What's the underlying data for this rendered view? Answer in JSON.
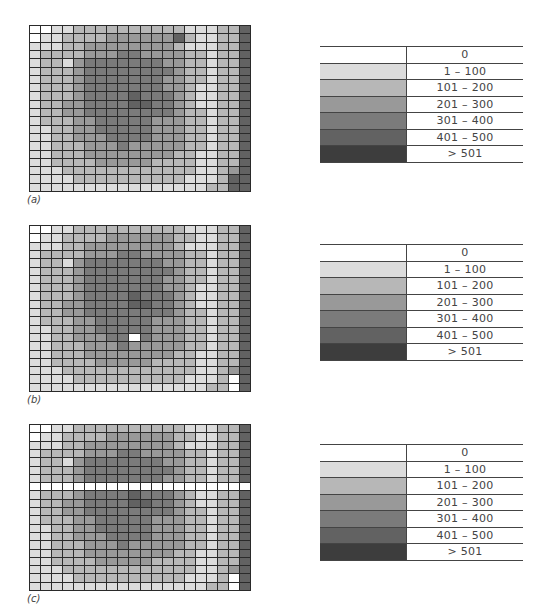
{
  "levels": [
    {
      "label": "0",
      "color": "#ffffff"
    },
    {
      "label": "1 – 100",
      "color": "#dcdcdc"
    },
    {
      "label": "101 – 200",
      "color": "#b7b7b7"
    },
    {
      "label": "201 – 300",
      "color": "#999999"
    },
    {
      "label": "301 – 400",
      "color": "#7b7b7b"
    },
    {
      "label": "401 – 500",
      "color": "#626262"
    },
    {
      "label": "> 501",
      "color": "#3d3d3d"
    }
  ],
  "panels": [
    {
      "label": "(a)",
      "grid": [
        "00112222222222111225",
        "01122223333335211225",
        "11122333333332111225",
        "12222333443333221225",
        "12213444444433221225",
        "12223444444443221225",
        "12223444444433221225",
        "12223444444433211225",
        "12223444454443211225",
        "12233444455443211225",
        "12233444444443221225",
        "12223344444333221225",
        "11223344444333221225",
        "11223334444333221225",
        "11222333433333221225",
        "11222333333332211225",
        "11222233333222211225",
        "11122222222222211235",
        "11112222222222111255",
        "11111111111111112255"
      ]
    },
    {
      "label": "(b)",
      "grid": [
        "00112222222222111225",
        "01122223333332211225",
        "11122333333332111225",
        "12222333443333221225",
        "12213444444433221225",
        "12223444444443221225",
        "12223444444433221225",
        "12223444444433211225",
        "12223444454443211225",
        "12233444455443211225",
        "12233444444443221225",
        "12223344444333221225",
        "11223344444333221225",
        "11223334404333221225",
        "11222333433333221225",
        "11222333333332211225",
        "11222233333222211225",
        "11122222222222211235",
        "11112222222222111205",
        "11111111111111112205"
      ]
    },
    {
      "label": "(c)",
      "grid": [
        "00112222222222111225",
        "01122223333332211225",
        "11122333333332111225",
        "12222333443333221225",
        "12213444444433221225",
        "12223444444443221225",
        "12223444444433221225",
        "00000000000000000000",
        "12223444454443211225",
        "12233444455443211225",
        "12233444444443221225",
        "12223344444333221225",
        "11223344444333221225",
        "11223334444333221225",
        "11222333433333221225",
        "11222333333332211225",
        "11222233333222211225",
        "11122222222222211235",
        "11112222222222111205",
        "11111111111111112205"
      ]
    }
  ]
}
